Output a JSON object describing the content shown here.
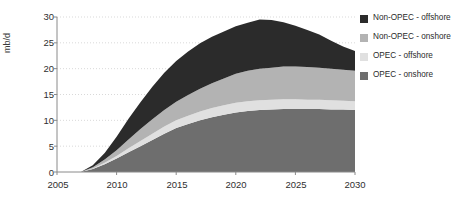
{
  "chart_data": {
    "type": "area",
    "title": "",
    "subtitle": "",
    "xlabel": "",
    "ylabel": "mb/d",
    "stacked": true,
    "grid": true,
    "legend_position": "right",
    "xlim": [
      2005,
      2030
    ],
    "ylim": [
      0,
      30
    ],
    "yticks": [
      0,
      5,
      10,
      15,
      20,
      25,
      30
    ],
    "xticks": [
      2005,
      2010,
      2015,
      2020,
      2025,
      2030
    ],
    "x": [
      2005,
      2006,
      2007,
      2008,
      2009,
      2010,
      2011,
      2012,
      2013,
      2014,
      2015,
      2016,
      2017,
      2018,
      2019,
      2020,
      2021,
      2022,
      2023,
      2024,
      2025,
      2026,
      2027,
      2028,
      2029,
      2030
    ],
    "series": [
      {
        "name": "OPEC - onshore",
        "color": "#6e6e6e",
        "values": [
          0,
          0,
          0,
          0.6,
          1.5,
          2.6,
          3.8,
          5.0,
          6.2,
          7.4,
          8.5,
          9.3,
          10.0,
          10.6,
          11.1,
          11.5,
          11.8,
          12.0,
          12.1,
          12.2,
          12.2,
          12.2,
          12.2,
          12.1,
          12.1,
          12.0
        ]
      },
      {
        "name": "OPEC - offshore",
        "color": "#e0e0e0",
        "values": [
          0,
          0,
          0,
          0.1,
          0.3,
          0.5,
          0.8,
          1.0,
          1.2,
          1.4,
          1.5,
          1.6,
          1.7,
          1.8,
          1.8,
          1.9,
          1.9,
          1.9,
          1.9,
          1.9,
          1.9,
          1.8,
          1.8,
          1.8,
          1.7,
          1.7
        ]
      },
      {
        "name": "Non-OPEC - onshore",
        "color": "#b3b3b3",
        "values": [
          0,
          0,
          0,
          0.2,
          0.6,
          1.1,
          1.7,
          2.3,
          2.8,
          3.2,
          3.6,
          4.0,
          4.4,
          4.8,
          5.2,
          5.6,
          5.9,
          6.1,
          6.2,
          6.3,
          6.3,
          6.3,
          6.2,
          6.1,
          6.0,
          5.9
        ]
      },
      {
        "name": "Non-OPEC - offshore",
        "color": "#2b2b2b",
        "values": [
          0,
          0,
          0,
          0.4,
          1.3,
          2.6,
          4.0,
          5.2,
          6.3,
          7.2,
          7.9,
          8.4,
          8.8,
          9.0,
          9.1,
          9.2,
          9.3,
          9.5,
          9.2,
          8.6,
          7.9,
          7.2,
          6.4,
          5.4,
          4.5,
          3.8
        ]
      }
    ],
    "legend": [
      {
        "label": "Non-OPEC - offshore",
        "color": "#2b2b2b"
      },
      {
        "label": "Non-OPEC - onshore",
        "color": "#b3b3b3"
      },
      {
        "label": "OPEC - offshore",
        "color": "#e0e0e0"
      },
      {
        "label": "OPEC - onshore",
        "color": "#6e6e6e"
      }
    ]
  },
  "axes": {
    "ylabel": "mb/d",
    "ytick_labels": [
      "30",
      "25",
      "20",
      "15",
      "10",
      "5",
      "0"
    ],
    "xtick_labels": [
      "2005",
      "2010",
      "2015",
      "2020",
      "2025",
      "2030"
    ]
  },
  "colors": {
    "background": "#ffffff",
    "axis": "#8a8a8a",
    "grid": "#d9d9d9",
    "text": "#2b2b2b"
  }
}
